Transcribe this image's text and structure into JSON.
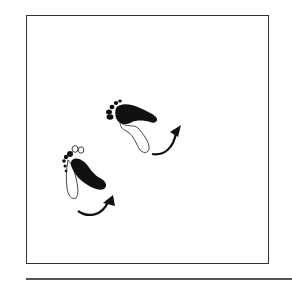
{
  "figure": {
    "colors": {
      "frame": "#333333",
      "ink": "#111111",
      "outline": "#444444",
      "rule": "#555555",
      "background": "#ffffff"
    },
    "elements": [
      {
        "name": "footprint-upper",
        "foot": "right",
        "style": "filled sole with outlined heel",
        "arrow": "curved-clockwise-up"
      },
      {
        "name": "footprint-lower",
        "foot": "left",
        "style": "filled sole with outlined heel and outlined toes",
        "arrow": "curved-clockwise-up"
      }
    ]
  }
}
